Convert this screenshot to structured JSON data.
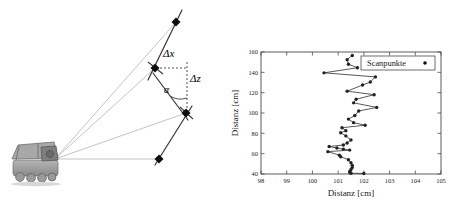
{
  "figure": {
    "panels": [
      "laser-scan-geometry-diagram",
      "scan-point-plot"
    ]
  },
  "left_panel": {
    "name": "laser-scan-geometry-diagram",
    "vehicle": {
      "icon": "mobile-robot-icon",
      "description": "six-wheeled mobile robot with mast-mounted laser scanner"
    },
    "annotations": [
      {
        "id": "delta-x",
        "label": "Δx",
        "style": "italic",
        "kind": "horizontal-offset"
      },
      {
        "id": "delta-z",
        "label": "Δz",
        "style": "italic",
        "kind": "vertical-offset"
      },
      {
        "id": "alpha",
        "label": "α",
        "style": "italic",
        "kind": "incidence-angle"
      }
    ],
    "scan_points": [
      {
        "id": "p1",
        "x": 176,
        "y": 22,
        "marker": "filled-diamond"
      },
      {
        "id": "p2",
        "x": 155,
        "y": 68,
        "marker": "filled-diamond"
      },
      {
        "id": "p3",
        "x": 186,
        "y": 113,
        "marker": "filled-diamond"
      },
      {
        "id": "p4",
        "x": 159,
        "y": 159,
        "marker": "filled-diamond"
      }
    ],
    "ray_origin": {
      "x": 55,
      "y": 159
    },
    "colors": {
      "ray": "#b4b4b4",
      "surface_line": "#3a3a3a",
      "dashed_guide": "#4a4a4a",
      "vehicle_body": "#8d8d8d"
    }
  },
  "right_panel": {
    "name": "scan-point-plot"
  },
  "chart_data": {
    "type": "line",
    "title": "",
    "xlabel": "Distanz [cm]",
    "ylabel": "Distanz [cm]",
    "xlim": [
      98,
      105
    ],
    "ylim": [
      40,
      160
    ],
    "xticks": [
      98,
      99,
      100,
      101,
      102,
      103,
      104,
      105
    ],
    "xticklabels": [
      "98",
      "99",
      "100",
      "101",
      "102",
      "103",
      "104",
      "105"
    ],
    "yticks": [
      40,
      60,
      80,
      100,
      120,
      140,
      160
    ],
    "yticklabels": [
      "40",
      "60",
      "80",
      "100",
      "120",
      "140",
      "160"
    ],
    "grid": false,
    "legend": {
      "position": "upper right",
      "entries": [
        "Scanpunkte"
      ]
    },
    "series": [
      {
        "name": "Scanpunkte",
        "marker": "filled-circle",
        "linestyle": "solid",
        "color": "#222222",
        "x": [
          101.55,
          101.35,
          101.4,
          101.75,
          100.45,
          102.45,
          102.25,
          101.95,
          101.35,
          102.4,
          101.7,
          101.6,
          102.5,
          101.8,
          101.65,
          101.4,
          101.6,
          102.05,
          101.15,
          101.3,
          101.1,
          101.3,
          101.5,
          101.35,
          101.2,
          100.65,
          100.95,
          101.2,
          101.45,
          100.6,
          101.05,
          101.1,
          101.4,
          101.5,
          101.55,
          101.55,
          101.5,
          101.45,
          101.45,
          101.5,
          102.0
        ],
        "y": [
          156.5,
          152.5,
          148.0,
          144.5,
          139.5,
          135.5,
          130.5,
          127.5,
          121.5,
          118.0,
          113.5,
          110.0,
          105.5,
          102.0,
          97.5,
          94.0,
          90.5,
          88.0,
          85.5,
          82.5,
          80.5,
          77.5,
          73.5,
          70.5,
          68.5,
          67.0,
          65.5,
          64.5,
          63.5,
          62.0,
          58.5,
          57.0,
          54.0,
          51.0,
          48.5,
          46.5,
          44.5,
          42.5,
          41.5,
          40.8,
          40.5
        ]
      }
    ]
  }
}
